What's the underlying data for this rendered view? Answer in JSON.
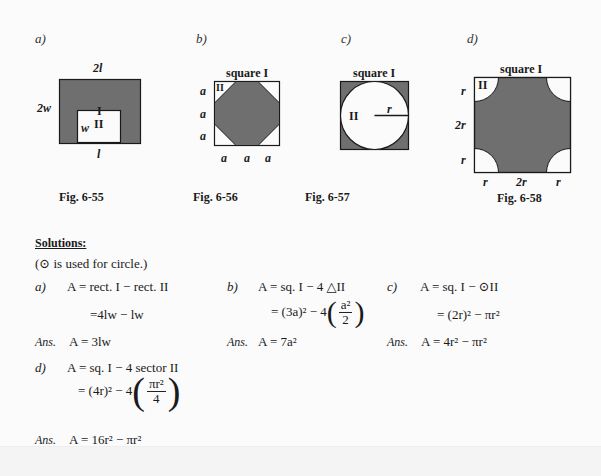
{
  "figures": {
    "a": {
      "label": "a)",
      "caption": "Fig. 6-55",
      "top_dim": "2l",
      "left_dim": "2w",
      "bottom_dim": "l",
      "inner_dim": "w",
      "region1": "I",
      "region2": "II"
    },
    "b": {
      "label": "b)",
      "caption": "Fig. 6-56",
      "title": "square I",
      "region": "II",
      "side_labels": [
        "a",
        "a",
        "a"
      ],
      "bottom_labels": [
        "a",
        "a",
        "a"
      ]
    },
    "c": {
      "label": "c)",
      "caption": "Fig. 6-57",
      "title": "square I",
      "region": "II",
      "radius_label": "r"
    },
    "d": {
      "label": "d)",
      "caption": "Fig. 6-58",
      "title": "square I",
      "region": "II",
      "side_labels": [
        "r",
        "2r",
        "r"
      ],
      "bottom_labels": [
        "r",
        "2r",
        "r"
      ]
    }
  },
  "colors": {
    "shade": "#6f6f6f",
    "stroke": "#1a1a1a",
    "paper": "#fbfbfb"
  },
  "solutions": {
    "heading": "Solutions:",
    "note": "(⊙ is used for circle.)",
    "a": {
      "label": "a)",
      "line1": "A = rect. I − rect. II",
      "line2": "=4lw − lw",
      "ans_label": "Ans.",
      "ans": "A = 3lw"
    },
    "b": {
      "label": "b)",
      "line1": "A = sq. I − 4 △II",
      "line2_prefix": "= (3a)² − 4",
      "frac_num": "a²",
      "frac_den": "2",
      "ans_label": "Ans.",
      "ans": "A = 7a²"
    },
    "c": {
      "label": "c)",
      "line1": "A = sq. I − ⊙II",
      "line2": "= (2r)² − πr²",
      "ans_label": "Ans.",
      "ans": "A = 4r² − πr²"
    },
    "d": {
      "label": "d)",
      "line1": "A = sq. I − 4 sector II",
      "line2_prefix": "= (4r)² − 4",
      "frac_num": "πr²",
      "frac_den": "4",
      "ans_label": "Ans.",
      "ans": "A = 16r² − πr²"
    }
  }
}
